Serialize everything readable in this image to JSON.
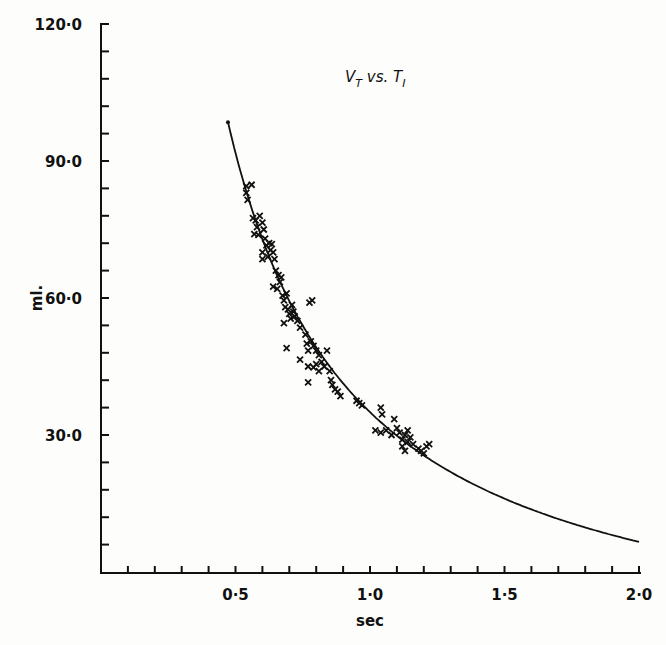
{
  "chart_data": {
    "type": "scatter",
    "title_parts": {
      "main1": "V",
      "sub1": "T",
      "mid": " vs. ",
      "main2": "T",
      "sub2": "I"
    },
    "xlabel": "sec",
    "ylabel": "ml.",
    "xlim": [
      0,
      2.0
    ],
    "ylim": [
      0,
      120
    ],
    "x_ticks": [
      0.1,
      0.2,
      0.3,
      0.4,
      0.5,
      0.6,
      0.7,
      0.8,
      0.9,
      1.0,
      1.1,
      1.2,
      1.3,
      1.4,
      1.5,
      1.6,
      1.7,
      1.8,
      1.9,
      2.0
    ],
    "x_tick_labels": [
      {
        "value": 0.5,
        "label": "0·5"
      },
      {
        "value": 1.0,
        "label": "1·0"
      },
      {
        "value": 1.5,
        "label": "1·5"
      },
      {
        "value": 2.0,
        "label": "2·0"
      }
    ],
    "y_ticks": [
      6,
      12,
      18,
      24,
      30,
      36,
      42,
      48,
      54,
      60,
      66,
      72,
      78,
      84,
      90,
      96,
      102,
      108,
      114,
      120
    ],
    "y_tick_labels": [
      {
        "value": 30,
        "label": "30·0"
      },
      {
        "value": 60,
        "label": "60·0"
      },
      {
        "value": 90,
        "label": "90·0"
      },
      {
        "value": 120,
        "label": "120·0"
      }
    ],
    "grid": false,
    "legend": null,
    "series": [
      {
        "name": "observations",
        "marker": "x",
        "points": [
          [
            0.54,
            84.5
          ],
          [
            0.54,
            83.0
          ],
          [
            0.545,
            81.5
          ],
          [
            0.56,
            84.8
          ],
          [
            0.565,
            77.5
          ],
          [
            0.575,
            77.0
          ],
          [
            0.58,
            75.5
          ],
          [
            0.585,
            73.8
          ],
          [
            0.57,
            74.0
          ],
          [
            0.59,
            78.0
          ],
          [
            0.6,
            76.5
          ],
          [
            0.605,
            75.0
          ],
          [
            0.61,
            73.0
          ],
          [
            0.615,
            71.5
          ],
          [
            0.6,
            70.0
          ],
          [
            0.62,
            69.0
          ],
          [
            0.625,
            72.0
          ],
          [
            0.63,
            70.5
          ],
          [
            0.635,
            71.8
          ],
          [
            0.64,
            70.0
          ],
          [
            0.645,
            68.5
          ],
          [
            0.6,
            68.5
          ],
          [
            0.65,
            66.0
          ],
          [
            0.66,
            65.0
          ],
          [
            0.665,
            63.5
          ],
          [
            0.655,
            62.0
          ],
          [
            0.67,
            64.5
          ],
          [
            0.675,
            60.5
          ],
          [
            0.68,
            59.5
          ],
          [
            0.685,
            58.0
          ],
          [
            0.69,
            61.0
          ],
          [
            0.695,
            57.5
          ],
          [
            0.7,
            56.5
          ],
          [
            0.705,
            55.5
          ],
          [
            0.68,
            54.5
          ],
          [
            0.69,
            49.0
          ],
          [
            0.64,
            62.5
          ],
          [
            0.71,
            58.5
          ],
          [
            0.715,
            57.0
          ],
          [
            0.72,
            56.0
          ],
          [
            0.73,
            55.0
          ],
          [
            0.74,
            53.5
          ],
          [
            0.76,
            52.0
          ],
          [
            0.765,
            50.0
          ],
          [
            0.77,
            48.5
          ],
          [
            0.775,
            59.0
          ],
          [
            0.78,
            50.5
          ],
          [
            0.785,
            59.5
          ],
          [
            0.79,
            49.5
          ],
          [
            0.8,
            48.5
          ],
          [
            0.81,
            47.5
          ],
          [
            0.82,
            46.0
          ],
          [
            0.83,
            45.0
          ],
          [
            0.77,
            45.0
          ],
          [
            0.79,
            44.8
          ],
          [
            0.8,
            45.5
          ],
          [
            0.81,
            44.0
          ],
          [
            0.74,
            46.5
          ],
          [
            0.77,
            41.5
          ],
          [
            0.84,
            48.5
          ],
          [
            0.85,
            44.0
          ],
          [
            0.855,
            42.0
          ],
          [
            0.86,
            41.0
          ],
          [
            0.87,
            40.0
          ],
          [
            0.88,
            39.5
          ],
          [
            0.89,
            38.5
          ],
          [
            0.95,
            37.5
          ],
          [
            0.96,
            37.0
          ],
          [
            0.97,
            36.5
          ],
          [
            1.04,
            36.0
          ],
          [
            1.045,
            34.5
          ],
          [
            1.02,
            31.0
          ],
          [
            1.04,
            30.5
          ],
          [
            1.06,
            31.0
          ],
          [
            1.08,
            30.0
          ],
          [
            1.09,
            33.5
          ],
          [
            1.1,
            31.5
          ],
          [
            1.11,
            30.5
          ],
          [
            1.12,
            29.0
          ],
          [
            1.13,
            30.0
          ],
          [
            1.14,
            31.0
          ],
          [
            1.12,
            27.5
          ],
          [
            1.13,
            26.5
          ],
          [
            1.14,
            28.5
          ],
          [
            1.15,
            29.5
          ],
          [
            1.16,
            28.0
          ],
          [
            1.18,
            27.0
          ],
          [
            1.19,
            26.5
          ],
          [
            1.2,
            26.0
          ],
          [
            1.21,
            27.5
          ],
          [
            1.22,
            28.0
          ]
        ]
      },
      {
        "name": "fitted curve",
        "type": "line",
        "equation": "V = 56.8/T - 21.8",
        "x": [
          0.472,
          0.5,
          0.6,
          0.7,
          0.8,
          0.9,
          1.0,
          1.1,
          1.2,
          1.3,
          1.4,
          1.5,
          1.6,
          1.7,
          1.8,
          1.9,
          2.0
        ],
        "values": [
          98.5,
          91.8,
          74.9,
          59.3,
          49.2,
          41.3,
          35.0,
          29.8,
          25.5,
          21.9,
          18.8,
          16.1,
          13.7,
          11.6,
          9.8,
          8.1,
          6.6
        ]
      }
    ]
  }
}
